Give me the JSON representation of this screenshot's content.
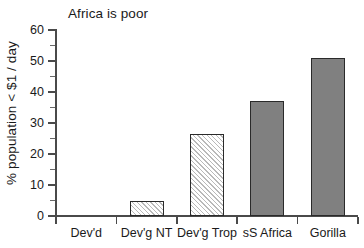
{
  "chart_data": {
    "type": "bar",
    "title": "Africa is poor",
    "xlabel": "",
    "ylabel": "% population < $1 / day",
    "categories": [
      "Dev'd",
      "Dev'g NT",
      "Dev'g Trop",
      "sS Africa",
      "Gorilla"
    ],
    "values": [
      0,
      5,
      26.5,
      37,
      51
    ],
    "ylim": [
      0,
      60
    ],
    "yticks": [
      0,
      10,
      20,
      30,
      40,
      50,
      60
    ],
    "ytick_labels": [
      "0",
      "10",
      "20",
      "30",
      "40",
      "50",
      "60"
    ],
    "grid": false,
    "legend": null,
    "series": [
      {
        "name": "% population < $1 / day",
        "values": [
          0,
          5,
          26.5,
          37,
          51
        ],
        "styles": [
          "none",
          "hatch",
          "hatch",
          "solid",
          "solid"
        ]
      }
    ],
    "colors": {
      "solid_fill": "#808080",
      "hatch_fill": "#ffffff",
      "hatch_stroke": "#b9b9b9",
      "bar_outline": "#2a2a2a",
      "axis": "#4a4a4a",
      "text": "#1a1a1a",
      "background": "#ffffff"
    }
  }
}
